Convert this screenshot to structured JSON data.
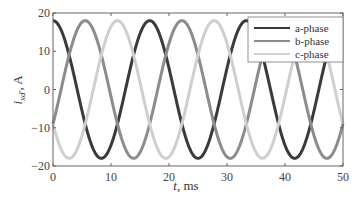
{
  "chart_data": {
    "type": "line",
    "title": "",
    "xlabel": "t,  ms",
    "ylabel": "i_xd',  A",
    "xlim": [
      0,
      50
    ],
    "ylim": [
      -20,
      20
    ],
    "xticks": [
      0,
      10,
      20,
      30,
      40,
      50
    ],
    "yticks": [
      -20,
      -10,
      0,
      10,
      20
    ],
    "grid": false,
    "legend_position": "upper right",
    "frequency_hz": 60,
    "amplitude_A": 18,
    "series": [
      {
        "name": "a-phase",
        "color": "#3a3a3a",
        "phase_deg": 0,
        "peaks_ms": [
          0,
          16.7,
          33.3,
          50
        ],
        "troughs_ms": [
          8.3,
          25,
          41.7
        ]
      },
      {
        "name": "b-phase",
        "color": "#8c8c8c",
        "phase_deg": -120,
        "peaks_ms": [
          5.6,
          22.2,
          38.9
        ],
        "troughs_ms": [
          13.9,
          30.6,
          47.2
        ]
      },
      {
        "name": "c-phase",
        "color": "#cfcfcf",
        "phase_deg": 120,
        "peaks_ms": [
          11.1,
          27.8,
          44.4
        ],
        "troughs_ms": [
          2.8,
          19.4,
          36.1
        ]
      }
    ]
  },
  "labels": {
    "x_axis": "t,  ms",
    "y_axis_main": "i",
    "y_axis_sub": "xd'",
    "y_axis_unit": ",  A",
    "legend": [
      "a-phase",
      "b-phase",
      "c-phase"
    ]
  }
}
